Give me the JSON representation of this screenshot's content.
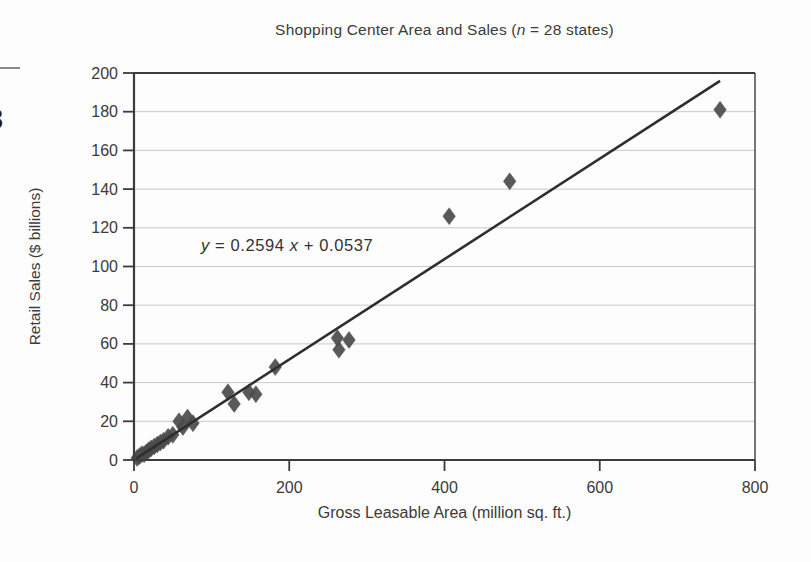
{
  "page": {
    "edge_glyph": "3"
  },
  "chart_data": {
    "type": "scatter",
    "title": "Shopping Center Area and Sales (n = 28 states)",
    "title_parts": {
      "prefix": "Shopping Center Area and Sales (",
      "italic_n": "n",
      "suffix": " = 28 states)"
    },
    "xlabel": "Gross Leasable Area (million sq. ft.)",
    "ylabel": "Retail Sales ($ billions)",
    "xlim": [
      0,
      800
    ],
    "ylim": [
      0,
      200
    ],
    "x_ticks": [
      0,
      200,
      400,
      600,
      800
    ],
    "y_ticks": [
      0,
      20,
      40,
      60,
      80,
      100,
      120,
      140,
      160,
      180,
      200
    ],
    "grid": "horizontal",
    "legend": "none",
    "points": [
      [
        4,
        1
      ],
      [
        7,
        2
      ],
      [
        10,
        3
      ],
      [
        13,
        3
      ],
      [
        16,
        4
      ],
      [
        19,
        5
      ],
      [
        22,
        6
      ],
      [
        26,
        7
      ],
      [
        30,
        8
      ],
      [
        34,
        9
      ],
      [
        38,
        10
      ],
      [
        44,
        12
      ],
      [
        50,
        13
      ],
      [
        58,
        20
      ],
      [
        63,
        17
      ],
      [
        69,
        22
      ],
      [
        76,
        19
      ],
      [
        121,
        35
      ],
      [
        129,
        29
      ],
      [
        148,
        35
      ],
      [
        157,
        34
      ],
      [
        182,
        48
      ],
      [
        262,
        63
      ],
      [
        264,
        57
      ],
      [
        277,
        62
      ],
      [
        406,
        126
      ],
      [
        484,
        144
      ],
      [
        755,
        181
      ]
    ],
    "trendline": {
      "slope": 0.2594,
      "intercept": 0.0537,
      "x_start": 3,
      "x_end": 755
    },
    "equation_parts": {
      "y_var": "y",
      "mid": " = 0.2594 ",
      "x_var": "x",
      "end": " + 0.0537"
    },
    "colors": {
      "point": "#4b4b4b",
      "line": "#2e2e2e",
      "grid": "#c8c8c8",
      "axis": "#3c3c3c",
      "text": "#3b3b3b"
    }
  }
}
